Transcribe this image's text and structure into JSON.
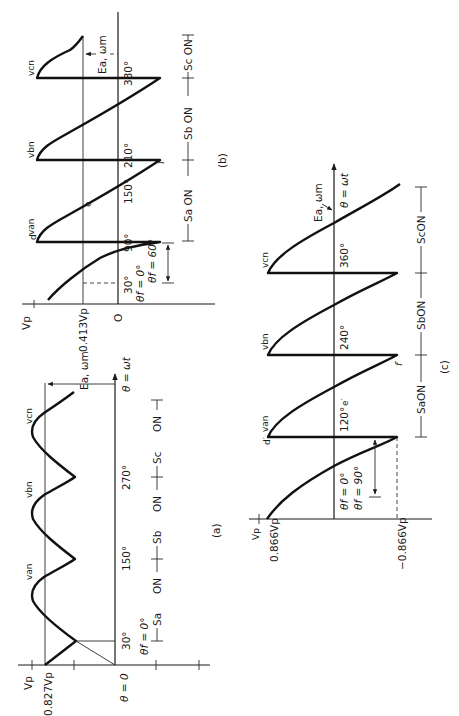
{
  "figure": {
    "orientation": "rotated 90 degrees counter-clockwise",
    "panels": {
      "a": {
        "caption": "(a)",
        "y_labels": {
          "vp": "Vₚ",
          "level": "0.827Vₚ"
        },
        "origin_label": "θ = 0",
        "axis_label": "θ = ωt",
        "angle_ticks": [
          "30°",
          "150°",
          "270°"
        ],
        "firing_angle": "θ₁ = 0°",
        "curve_labels": [
          "vₐₙ",
          "vᵦₙ",
          "vᶜₙ"
        ],
        "emf_label": "Eₐ, ωₘ",
        "switch_intervals": [
          "Sₐ  ON",
          "Sᵦ  ON",
          "Sᶜ  ON"
        ]
      },
      "b": {
        "caption": "(b)",
        "y_labels": {
          "vp": "Vₚ",
          "level": "0.413Vₚ",
          "zero": "O"
        },
        "angle_ticks": [
          "30°",
          "90°",
          "150°",
          "210°",
          "330°"
        ],
        "firing_angle_ref": "θ₁ = 0°",
        "firing_angle": "θ₁ = 60°",
        "curve_labels": [
          "vₐₙ",
          "vᵦₙ",
          "vᶜₙ"
        ],
        "point_labels": [
          "d",
          "e",
          "f"
        ],
        "emf_label": "Eₐ, ωₘ",
        "switch_intervals": [
          "Sₐ ON",
          "Sᵦ ON",
          "Sᶜ ON"
        ]
      },
      "c": {
        "caption": "(c)",
        "y_labels": {
          "vp": "Vₚ",
          "pos": "0.866Vₚ",
          "neg": "−0.866Vₚ"
        },
        "axis_label": "θ = ωt",
        "angle_ticks": [
          "120°",
          "240°",
          "360°"
        ],
        "firing_angle_ref": "θ₁ = 0°",
        "firing_angle": "θ₁ = 90°",
        "curve_labels": [
          "vₐₙ",
          "vᵦₙ",
          "vᶜₙ"
        ],
        "point_labels": [
          "d′",
          "e′",
          "f′"
        ],
        "emf_label": "Eₐ, ωₘ",
        "switch_intervals": [
          "SₐON",
          "SᵦON",
          "SᶜON"
        ]
      }
    }
  },
  "text": {
    "a_vp": "Vp",
    "a_level": "0.827Vp",
    "a_origin": "θ = 0",
    "a_axis": "θ = ωt",
    "a_t30": "30°",
    "a_t150": "150°",
    "a_t270": "270°",
    "a_fire": "θf = 0°",
    "a_van": "van",
    "a_vbn": "vbn",
    "a_vcn": "vcn",
    "a_emf": "Ea, ωm",
    "a_sa": "Sa",
    "a_sb": "Sb",
    "a_sc": "Sc",
    "a_on": "ON",
    "a_cap": "(a)",
    "b_vp": "Vp",
    "b_level": "0.413Vp",
    "b_zero": "O",
    "b_t30": "30°",
    "b_t90": "90°",
    "b_t150": "150°",
    "b_t210": "210°",
    "b_t330": "330°",
    "b_fire0": "θf = 0°",
    "b_fire": "θf = 60°",
    "b_van": "van",
    "b_vbn": "vbn",
    "b_vcn": "vcn",
    "b_d": "d",
    "b_e": "e",
    "b_f": "f",
    "b_emf": "Ea, ωm",
    "b_sa": "Sa ON",
    "b_sb": "Sb ON",
    "b_sc": "Sc ON",
    "b_cap": "(b)",
    "c_vp": "Vp",
    "c_pos": "0.866Vp",
    "c_neg": "−0.866Vp",
    "c_axis": "θ = ωt",
    "c_t120": "120°",
    "c_t240": "240°",
    "c_t360": "360°",
    "c_fire0": "θf = 0°",
    "c_fire": "θf = 90°",
    "c_van": "van",
    "c_vbn": "vbn",
    "c_vcn": "vcn",
    "c_d": "d′",
    "c_e": "e′",
    "c_f": "f′",
    "c_emf": "Ea, ωm",
    "c_sa": "SaON",
    "c_sb": "SbON",
    "c_sc": "ScON",
    "c_cap": "(c)"
  }
}
